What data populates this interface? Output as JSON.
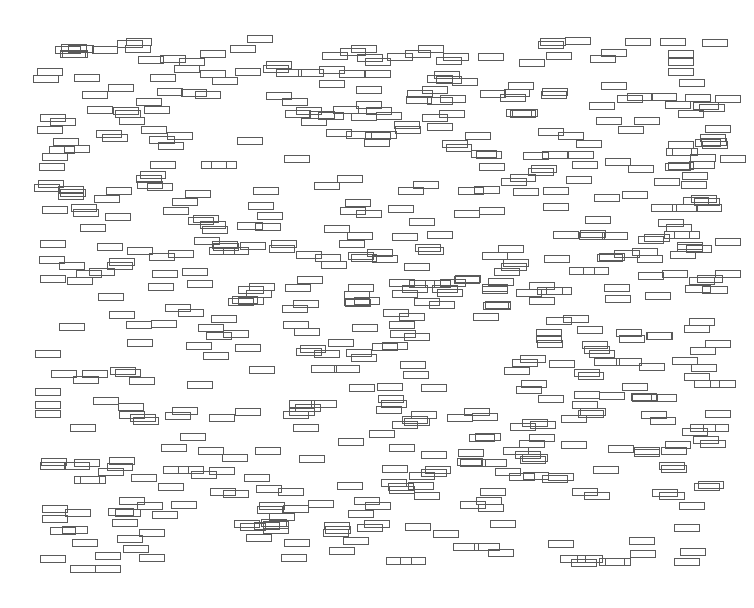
{
  "diagram": {
    "title": "",
    "background": "#ffffff",
    "stroke_color": "#5a5a5a",
    "box_width": 26,
    "box_height": 8,
    "bounds": {
      "x_min": 33,
      "x_max": 730,
      "y_min": 35,
      "y_max": 567
    },
    "seed": 7341,
    "box_count": 620,
    "anchors": [
      [
        702,
        39
      ],
      [
        33,
        75
      ],
      [
        60,
        50
      ],
      [
        125,
        45
      ],
      [
        160,
        55
      ],
      [
        200,
        50
      ],
      [
        230,
        45
      ],
      [
        540,
        38
      ],
      [
        565,
        37
      ],
      [
        625,
        38
      ],
      [
        660,
        38
      ],
      [
        668,
        50
      ],
      [
        668,
        58
      ],
      [
        668,
        68
      ],
      [
        340,
        48
      ],
      [
        365,
        58
      ],
      [
        440,
        95
      ],
      [
        480,
        90
      ],
      [
        40,
        240
      ],
      [
        40,
        275
      ],
      [
        35,
        350
      ],
      [
        35,
        410
      ],
      [
        40,
        462
      ],
      [
        42,
        515
      ],
      [
        40,
        555
      ],
      [
        70,
        565
      ],
      [
        95,
        565
      ],
      [
        560,
        555
      ],
      [
        630,
        550
      ],
      [
        680,
        548
      ],
      [
        700,
        440
      ],
      [
        705,
        410
      ],
      [
        710,
        380
      ],
      [
        705,
        340
      ],
      [
        715,
        238
      ],
      [
        715,
        270
      ],
      [
        720,
        155
      ],
      [
        705,
        125
      ],
      [
        715,
        95
      ]
    ]
  }
}
